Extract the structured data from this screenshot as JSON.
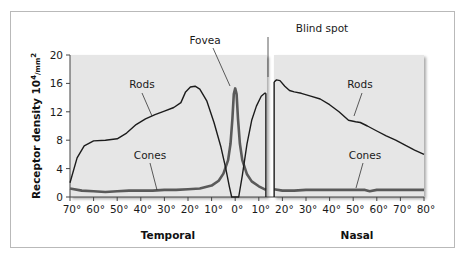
{
  "chart_data": {
    "type": "line",
    "title": "",
    "xlabel": "Eccentricity (degrees)",
    "ylabel": "Receptor density 10⁴/mm²",
    "ylabel_base": "Receptor density 10",
    "ylabel_exp": "4",
    "ylabel_unit": "/mm",
    "ylabel_unit_exp": "2",
    "ylim": [
      0,
      20
    ],
    "yticks": [
      "0",
      "4",
      "8",
      "12",
      "16",
      "20"
    ],
    "xticks": [
      "70°",
      "60°",
      "50°",
      "40°",
      "30°",
      "20°",
      "10°",
      "0°",
      "10°",
      "20°",
      "30°",
      "40°",
      "50°",
      "60°",
      "70°",
      "80°"
    ],
    "x_region_labels": {
      "temporal": "Temporal",
      "nasal": "Nasal"
    },
    "annotations": {
      "fovea": "Fovea",
      "blind_spot": "Blind spot",
      "rods_temporal": "Rods",
      "cones_temporal": "Cones",
      "rods_nasal": "Rods",
      "cones_nasal": "Cones"
    },
    "x_convention": "negative = temporal, positive = nasal (degrees from fovea)",
    "blind_spot_range": [
      13,
      16
    ],
    "grid": false,
    "series": [
      {
        "name": "Rods",
        "x": [
          -70,
          -67,
          -64,
          -60,
          -55,
          -50,
          -46,
          -42,
          -38,
          -34,
          -30,
          -26,
          -23,
          -21,
          -19,
          -17,
          -15,
          -12,
          -9,
          -6,
          -4,
          -2.5,
          -1.5,
          -0.5,
          0,
          0.5,
          1.5,
          3,
          5,
          7,
          9,
          11,
          12.5,
          13,
          null,
          16.5,
          17.5,
          19,
          21,
          23,
          25,
          28,
          32,
          36,
          40,
          44,
          48,
          51,
          53,
          56,
          60,
          64,
          68,
          72,
          76,
          80
        ],
        "values": [
          2.0,
          5.5,
          7.2,
          7.9,
          8.0,
          8.2,
          9.0,
          10.2,
          11.0,
          11.6,
          12.1,
          12.6,
          13.3,
          14.8,
          15.5,
          15.6,
          15.2,
          13.5,
          10.5,
          7.0,
          4.0,
          1.5,
          0.0,
          0.0,
          0.0,
          0.0,
          0.0,
          3.0,
          7.5,
          10.8,
          12.8,
          14.2,
          14.6,
          14.6,
          null,
          16.2,
          16.5,
          16.4,
          15.6,
          15.0,
          14.8,
          14.6,
          14.2,
          13.8,
          13.0,
          12.0,
          10.8,
          10.6,
          10.5,
          10.0,
          9.3,
          8.6,
          8.0,
          7.3,
          6.6,
          6.0
        ],
        "note": "Rods drop to 0 at the fovea; no data in blind spot"
      },
      {
        "name": "Cones",
        "x": [
          -70,
          -65,
          -60,
          -55,
          -50,
          -45,
          -40,
          -35,
          -30,
          -25,
          -20,
          -15,
          -10,
          -7,
          -5,
          -3,
          -2,
          -1.2,
          -0.6,
          0,
          0.6,
          1.2,
          2,
          3,
          5,
          7,
          10,
          13,
          null,
          16.5,
          20,
          25,
          30,
          35,
          40,
          45,
          50,
          55,
          57,
          60,
          65,
          70,
          75,
          80
        ],
        "values": [
          1.2,
          0.9,
          0.8,
          0.7,
          0.8,
          0.9,
          0.9,
          0.9,
          1.0,
          1.0,
          1.1,
          1.2,
          1.6,
          2.3,
          3.3,
          5.2,
          7.5,
          11.0,
          14.5,
          15.3,
          14.5,
          11.0,
          7.5,
          5.2,
          3.2,
          2.2,
          1.5,
          1.0,
          null,
          1.1,
          0.9,
          0.9,
          1.0,
          1.0,
          1.0,
          1.0,
          1.0,
          1.0,
          0.8,
          1.0,
          1.0,
          1.0,
          1.0,
          1.0
        ],
        "note": "Cones peak sharply at the fovea (~15 ×10⁴/mm²)"
      }
    ],
    "colors": {
      "panel_bg": "#e6e6e6",
      "rods": "#1c1c1c",
      "cones": "#5a5a5a",
      "frame": "#b9b9b9",
      "axis": "#444444"
    }
  }
}
